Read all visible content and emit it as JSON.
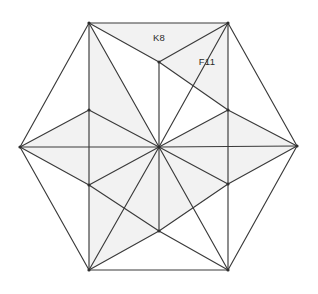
{
  "figure": {
    "kind": "geometric-mesh-diagram",
    "canvas": {
      "width": 318,
      "height": 294
    },
    "background_color": "#ffffff",
    "edge_color": "#3a3a3a",
    "shaded_face_color": "#f2f2f2",
    "plain_face_color": "#ffffff",
    "label_color": "#2b2b2b"
  },
  "labels": [
    {
      "id": "label-k8",
      "text": "K8",
      "x": 159,
      "y": 38
    },
    {
      "id": "label-f11",
      "text": "F11",
      "x": 207,
      "y": 62
    }
  ],
  "vertices": {
    "hex_left": {
      "name": "hex-left",
      "x": 20,
      "y": 147
    },
    "hex_right": {
      "name": "hex-right",
      "x": 297,
      "y": 146
    },
    "sq_top_left": {
      "name": "square-top-left",
      "x": 89,
      "y": 23
    },
    "sq_top_right": {
      "name": "square-top-right",
      "x": 228,
      "y": 23
    },
    "sq_bot_left": {
      "name": "square-bottom-left",
      "x": 89,
      "y": 270
    },
    "sq_bot_right": {
      "name": "square-bottom-right",
      "x": 228,
      "y": 270
    },
    "mid_left_upper": {
      "name": "mid-left-upper",
      "x": 89,
      "y": 110
    },
    "mid_left_lower": {
      "name": "mid-left-lower",
      "x": 89,
      "y": 185
    },
    "mid_right_upper": {
      "name": "mid-right-upper",
      "x": 228,
      "y": 110
    },
    "mid_right_lower": {
      "name": "mid-right-lower",
      "x": 228,
      "y": 184
    },
    "top_mid": {
      "name": "top-mid",
      "x": 159,
      "y": 62
    },
    "bot_mid": {
      "name": "bottom-mid",
      "x": 159,
      "y": 231
    },
    "center": {
      "name": "center-hub",
      "x": 159,
      "y": 147
    }
  },
  "faces": [
    {
      "id": "face-top-left-wing",
      "shade": "plain",
      "points": "89,23 89,110 20,147"
    },
    {
      "id": "face-left-upper-wing",
      "shade": "shaded",
      "points": "20,147 89,110 159,147"
    },
    {
      "id": "face-left-lower-wing",
      "shade": "shaded",
      "points": "20,147 159,147 89,185"
    },
    {
      "id": "face-bot-left-wing",
      "shade": "plain",
      "points": "20,147 89,185 89,270"
    },
    {
      "id": "face-top-right-wing",
      "shade": "plain",
      "points": "228,23 297,146 228,110"
    },
    {
      "id": "face-right-upper-wing",
      "shade": "shaded",
      "points": "228,110 297,146 159,147"
    },
    {
      "id": "face-right-lower-wing",
      "shade": "shaded",
      "points": "159,147 297,146 228,184"
    },
    {
      "id": "face-bot-right-wing",
      "shade": "plain",
      "points": "228,184 297,146 228,270"
    },
    {
      "id": "face-top-a",
      "shade": "plain",
      "points": "89,23 159,62 159,147"
    },
    {
      "id": "face-top-b",
      "shade": "shaded",
      "points": "89,23 159,147 89,110"
    },
    {
      "id": "face-top-c",
      "shade": "shaded",
      "points": "89,23 228,23 159,62"
    },
    {
      "id": "face-top-d",
      "shade": "shaded",
      "points": "159,62 228,23 228,110"
    },
    {
      "id": "face-top-e",
      "shade": "plain",
      "points": "159,62 228,110 159,147"
    },
    {
      "id": "face-bot-a",
      "shade": "shaded",
      "points": "89,185 159,147 159,231"
    },
    {
      "id": "face-bot-b",
      "shade": "shaded",
      "points": "89,185 159,231 89,270"
    },
    {
      "id": "face-bot-c",
      "shade": "plain",
      "points": "89,270 159,231 228,270"
    },
    {
      "id": "face-bot-d",
      "shade": "plain",
      "points": "159,231 228,184 228,270"
    },
    {
      "id": "face-bot-e",
      "shade": "shaded",
      "points": "159,147 228,184 159,231"
    }
  ],
  "edges": [
    {
      "id": "edge-hex-tl-tr",
      "x1": 89,
      "y1": 23,
      "x2": 228,
      "y2": 23
    },
    {
      "id": "edge-hex-tr-r",
      "x1": 228,
      "y1": 23,
      "x2": 297,
      "y2": 146
    },
    {
      "id": "edge-hex-r-br",
      "x1": 297,
      "y1": 146,
      "x2": 228,
      "y2": 270
    },
    {
      "id": "edge-hex-br-bl",
      "x1": 228,
      "y1": 270,
      "x2": 89,
      "y2": 270
    },
    {
      "id": "edge-hex-bl-l",
      "x1": 89,
      "y1": 270,
      "x2": 20,
      "y2": 147
    },
    {
      "id": "edge-hex-l-tl",
      "x1": 20,
      "y1": 147,
      "x2": 89,
      "y2": 23
    },
    {
      "id": "edge-sq-left",
      "x1": 89,
      "y1": 23,
      "x2": 89,
      "y2": 270
    },
    {
      "id": "edge-sq-right",
      "x1": 228,
      "y1": 23,
      "x2": 228,
      "y2": 270
    },
    {
      "id": "edge-spoke-tl",
      "x1": 159,
      "y1": 147,
      "x2": 89,
      "y2": 23
    },
    {
      "id": "edge-spoke-tm",
      "x1": 159,
      "y1": 147,
      "x2": 159,
      "y2": 62
    },
    {
      "id": "edge-spoke-tr",
      "x1": 159,
      "y1": 147,
      "x2": 228,
      "y2": 23
    },
    {
      "id": "edge-spoke-mru",
      "x1": 159,
      "y1": 147,
      "x2": 228,
      "y2": 110
    },
    {
      "id": "edge-spoke-r",
      "x1": 159,
      "y1": 147,
      "x2": 297,
      "y2": 146
    },
    {
      "id": "edge-spoke-mrl",
      "x1": 159,
      "y1": 147,
      "x2": 228,
      "y2": 184
    },
    {
      "id": "edge-spoke-br",
      "x1": 159,
      "y1": 147,
      "x2": 228,
      "y2": 270
    },
    {
      "id": "edge-spoke-bm",
      "x1": 159,
      "y1": 147,
      "x2": 159,
      "y2": 231
    },
    {
      "id": "edge-spoke-bl",
      "x1": 159,
      "y1": 147,
      "x2": 89,
      "y2": 270
    },
    {
      "id": "edge-spoke-mll",
      "x1": 159,
      "y1": 147,
      "x2": 89,
      "y2": 185
    },
    {
      "id": "edge-spoke-l",
      "x1": 159,
      "y1": 147,
      "x2": 20,
      "y2": 147
    },
    {
      "id": "edge-spoke-mlu",
      "x1": 159,
      "y1": 147,
      "x2": 89,
      "y2": 110
    },
    {
      "id": "edge-chord-tl-tm",
      "x1": 89,
      "y1": 23,
      "x2": 159,
      "y2": 62
    },
    {
      "id": "edge-chord-tm-tr",
      "x1": 159,
      "y1": 62,
      "x2": 228,
      "y2": 23
    },
    {
      "id": "edge-chord-tm-mru",
      "x1": 159,
      "y1": 62,
      "x2": 228,
      "y2": 110
    },
    {
      "id": "edge-chord-mlu-l",
      "x1": 89,
      "y1": 110,
      "x2": 20,
      "y2": 147
    },
    {
      "id": "edge-chord-l-mll",
      "x1": 20,
      "y1": 147,
      "x2": 89,
      "y2": 185
    },
    {
      "id": "edge-chord-mru-r",
      "x1": 228,
      "y1": 110,
      "x2": 297,
      "y2": 146
    },
    {
      "id": "edge-chord-r-mrl",
      "x1": 297,
      "y1": 146,
      "x2": 228,
      "y2": 184
    },
    {
      "id": "edge-chord-bl-bm",
      "x1": 89,
      "y1": 270,
      "x2": 159,
      "y2": 231
    },
    {
      "id": "edge-chord-bm-br",
      "x1": 159,
      "y1": 231,
      "x2": 228,
      "y2": 270
    },
    {
      "id": "edge-chord-mrl-bm",
      "x1": 228,
      "y1": 184,
      "x2": 159,
      "y2": 231
    },
    {
      "id": "edge-chord-mll-bm",
      "x1": 89,
      "y1": 185,
      "x2": 159,
      "y2": 231
    }
  ]
}
